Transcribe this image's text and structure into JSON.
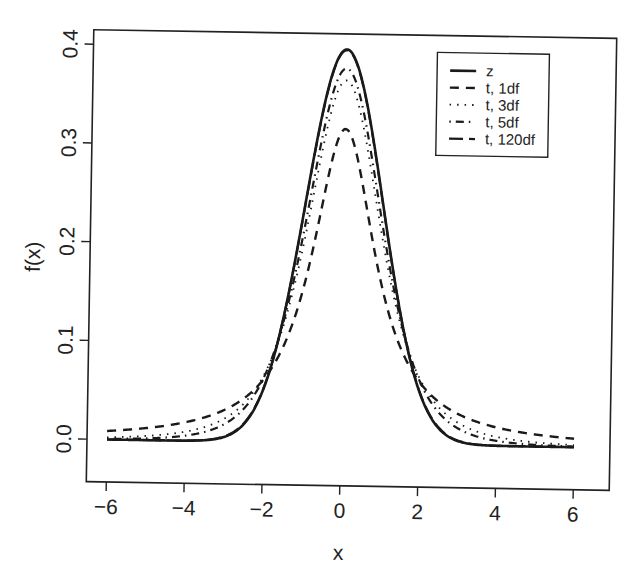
{
  "chart_data": {
    "type": "line",
    "title": "",
    "xlabel": "x",
    "ylabel": "f(x)",
    "xlim": [
      -6,
      6
    ],
    "ylim": [
      0,
      0.4
    ],
    "xticks": [
      -6,
      -4,
      -2,
      0,
      2,
      4,
      6
    ],
    "xtick_labels": [
      "−6",
      "−4",
      "−2",
      "0",
      "2",
      "4",
      "6"
    ],
    "yticks": [
      0.0,
      0.1,
      0.2,
      0.3,
      0.4
    ],
    "ytick_labels": [
      "0.0",
      "0.1",
      "0.2",
      "0.3",
      "0.4"
    ],
    "grid": false,
    "legend_position": "top-right",
    "x": [
      -6,
      -5.5,
      -5,
      -4.5,
      -4,
      -3.5,
      -3,
      -2.5,
      -2,
      -1.5,
      -1,
      -0.5,
      0,
      0.5,
      1,
      1.5,
      2,
      2.5,
      3,
      3.5,
      4,
      4.5,
      5,
      5.5,
      6
    ],
    "series": [
      {
        "name": "z",
        "dist": "normal",
        "df": null,
        "line_style": "solid",
        "values": [
          0.0,
          0.0,
          0.0,
          0.0,
          0.0001,
          0.0009,
          0.0044,
          0.0175,
          0.054,
          0.1295,
          0.242,
          0.3521,
          0.3989,
          0.3521,
          0.242,
          0.1295,
          0.054,
          0.0175,
          0.0044,
          0.0009,
          0.0001,
          0.0,
          0.0,
          0.0,
          0.0
        ]
      },
      {
        "name": "t, 1df",
        "dist": "t",
        "df": 1,
        "line_style": "dashed",
        "values": [
          0.0086,
          0.0102,
          0.0122,
          0.015,
          0.0187,
          0.0241,
          0.0318,
          0.0439,
          0.0637,
          0.0979,
          0.1592,
          0.2546,
          0.3183,
          0.2546,
          0.1592,
          0.0979,
          0.0637,
          0.0439,
          0.0318,
          0.0241,
          0.0187,
          0.015,
          0.0122,
          0.0102,
          0.0086
        ]
      },
      {
        "name": "t, 3df",
        "dist": "t",
        "df": 3,
        "line_style": "dotted",
        "values": [
          0.0022,
          0.003,
          0.0042,
          0.0061,
          0.0092,
          0.0142,
          0.023,
          0.0387,
          0.0675,
          0.12,
          0.2067,
          0.3132,
          0.3676,
          0.3132,
          0.2067,
          0.12,
          0.0675,
          0.0387,
          0.023,
          0.0142,
          0.0092,
          0.0061,
          0.0042,
          0.003,
          0.0022
        ]
      },
      {
        "name": "t, 5df",
        "dist": "t",
        "df": 5,
        "line_style": "dotdash",
        "values": [
          0.0007,
          0.0011,
          0.0018,
          0.0029,
          0.0051,
          0.0092,
          0.0173,
          0.0333,
          0.0651,
          0.1245,
          0.2197,
          0.3279,
          0.3796,
          0.3279,
          0.2197,
          0.1245,
          0.0651,
          0.0333,
          0.0173,
          0.0092,
          0.0051,
          0.0029,
          0.0018,
          0.0011,
          0.0007
        ]
      },
      {
        "name": "t, 120df",
        "dist": "t",
        "df": 120,
        "line_style": "longdash",
        "values": [
          0.0,
          0.0,
          0.0,
          0.0,
          0.0002,
          0.001,
          0.0047,
          0.0181,
          0.0548,
          0.1299,
          0.2419,
          0.3515,
          0.3981,
          0.3515,
          0.2419,
          0.1299,
          0.0548,
          0.0181,
          0.0047,
          0.001,
          0.0002,
          0.0,
          0.0,
          0.0,
          0.0
        ]
      }
    ],
    "legend": [
      "z",
      "t, 1df",
      "t, 3df",
      "t, 5df",
      "t, 120df"
    ],
    "colors": {
      "ink": "#1a1a1a",
      "background": "#ffffff"
    }
  }
}
